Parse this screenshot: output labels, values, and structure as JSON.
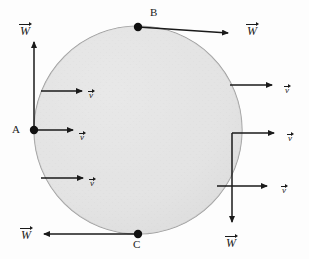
{
  "figure": {
    "background_color": "#fdfdfd",
    "stroke_color": "#1a1a1a",
    "circle": {
      "name": "ball",
      "cx": 138,
      "cy": 130,
      "r": 104,
      "fill_color": "#e3e3e3",
      "edge_color": "#9a9a9a"
    },
    "points": [
      {
        "id": "A",
        "label": "A",
        "x": 34,
        "y": 130,
        "label_x": 12,
        "label_y": 124
      },
      {
        "id": "B",
        "label": "B",
        "x": 138,
        "y": 26,
        "label_x": 150,
        "label_y": 7
      },
      {
        "id": "C",
        "label": "C",
        "x": 138,
        "y": 234,
        "label_x": 133,
        "label_y": 239
      }
    ],
    "vectors": [
      {
        "name": "weight-at-A",
        "symbol": "W",
        "label_x": 20,
        "label_y": 22,
        "x1": 34,
        "y1": 130,
        "x2": 34,
        "y2": 42,
        "direction": "up"
      },
      {
        "name": "weight-at-B",
        "symbol": "W",
        "label_x": 247,
        "label_y": 22,
        "x1": 138,
        "y1": 28,
        "x2": 228,
        "y2": 33,
        "direction": "right"
      },
      {
        "name": "weight-at-C",
        "symbol": "W",
        "label_x": 21,
        "label_y": 226,
        "x1": 138,
        "y1": 234,
        "x2": 44,
        "y2": 234,
        "direction": "left"
      },
      {
        "name": "weight-right-side",
        "symbol": "W",
        "label_x": 226,
        "label_y": 234,
        "x1": 232,
        "y1": 133,
        "x2": 232,
        "y2": 222,
        "direction": "down"
      },
      {
        "name": "velocity-upper-left",
        "symbol": "v",
        "label_x": 89,
        "label_y": 85,
        "x1": 41,
        "y1": 91,
        "x2": 82,
        "y2": 91,
        "direction": "right"
      },
      {
        "name": "velocity-at-A",
        "symbol": "v",
        "label_x": 80,
        "label_y": 127,
        "x1": 34,
        "y1": 130,
        "x2": 73,
        "y2": 130,
        "direction": "right"
      },
      {
        "name": "velocity-lower-left",
        "symbol": "v",
        "label_x": 90,
        "label_y": 173,
        "x1": 41,
        "y1": 178,
        "x2": 83,
        "y2": 178,
        "direction": "right"
      },
      {
        "name": "velocity-upper-right",
        "symbol": "v",
        "label_x": 285,
        "label_y": 80,
        "x1": 230,
        "y1": 85,
        "x2": 272,
        "y2": 85,
        "direction": "right"
      },
      {
        "name": "velocity-middle-right",
        "symbol": "v",
        "label_x": 288,
        "label_y": 128,
        "x1": 232,
        "y1": 133,
        "x2": 274,
        "y2": 133,
        "direction": "right"
      },
      {
        "name": "velocity-lower-right",
        "symbol": "v",
        "label_x": 282,
        "label_y": 180,
        "x1": 217,
        "y1": 186,
        "x2": 267,
        "y2": 186,
        "direction": "right"
      }
    ]
  }
}
